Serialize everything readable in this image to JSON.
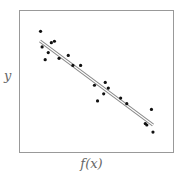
{
  "chart_data": {
    "type": "scatter",
    "title": "",
    "xlabel": "f(x)",
    "ylabel": "y",
    "grid": false,
    "legend": null,
    "axis_ticks": false,
    "x": [
      0.14,
      0.15,
      0.17,
      0.19,
      0.21,
      0.23,
      0.26,
      0.32,
      0.35,
      0.4,
      0.49,
      0.51,
      0.55,
      0.56,
      0.58,
      0.66,
      0.7,
      0.82,
      0.83,
      0.86,
      0.87
    ],
    "y": [
      0.85,
      0.74,
      0.65,
      0.7,
      0.77,
      0.78,
      0.66,
      0.68,
      0.61,
      0.61,
      0.47,
      0.36,
      0.41,
      0.49,
      0.45,
      0.38,
      0.34,
      0.2,
      0.19,
      0.3,
      0.14
    ],
    "fit_line": {
      "x": [
        0.14,
        0.87
      ],
      "y": [
        0.78,
        0.19
      ],
      "style": "double gray line"
    },
    "colors": {
      "points": "#111111",
      "line": "#999999",
      "frame": "#999999"
    }
  }
}
